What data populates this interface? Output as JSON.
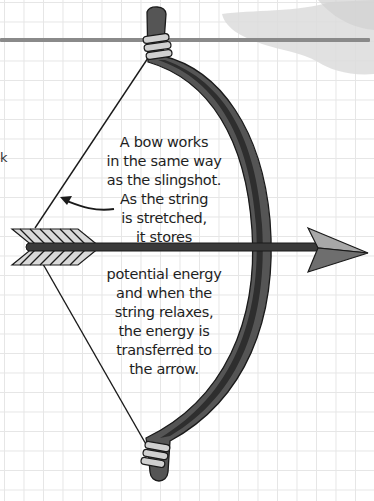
{
  "diagram": {
    "caption_top": {
      "lines": [
        "A bow works",
        "in the same way",
        "as the slingshot.",
        "As the string",
        "is stretched,",
        "it stores"
      ]
    },
    "caption_bottom": {
      "lines": [
        "potential energy",
        "and when the",
        "string relaxes,",
        "the energy is",
        "transferred to",
        "the arrow."
      ]
    },
    "edge_fragment": "k",
    "elements": [
      "bow",
      "bowstring",
      "arrow",
      "arrow-fletching",
      "arrowhead",
      "curved-pointer-arrow",
      "horizontal-line",
      "grey-smudge",
      "grid-background"
    ],
    "colors": {
      "bow_body": "#555555",
      "bow_shadow": "#2e2e2e",
      "outline": "#1a1a1a",
      "grip_wraps": "#d0d0d0",
      "arrowhead_light": "#a8a8a8",
      "arrowhead_dark": "#6e6e6e",
      "fletching": "#d9d9d9",
      "horizontal_line": "#8a8a8a",
      "smudge": "#dcdcdc",
      "grid": "#e6e6e6",
      "text": "#1e1e1e"
    }
  }
}
